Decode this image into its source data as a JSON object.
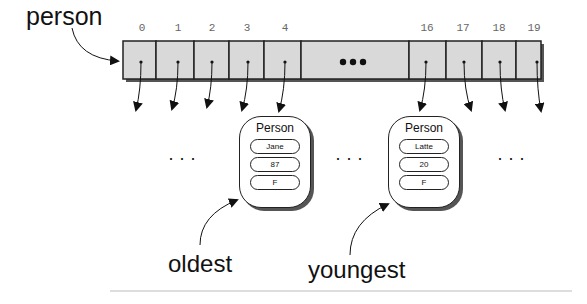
{
  "array": {
    "name": "person",
    "indices": [
      "0",
      "1",
      "2",
      "3",
      "4",
      "16",
      "17",
      "18",
      "19"
    ],
    "ellipsis": "●●●",
    "cell_fill": "#d9d9d9"
  },
  "objects": [
    {
      "title": "Person",
      "fields": [
        "Jane",
        "87",
        "F"
      ],
      "label": "oldest"
    },
    {
      "title": "Person",
      "fields": [
        "Latte",
        "20",
        "F"
      ],
      "label": "youngest"
    }
  ],
  "gap_ellipses": [
    "· · ·",
    "· · ·",
    "· · ·"
  ]
}
